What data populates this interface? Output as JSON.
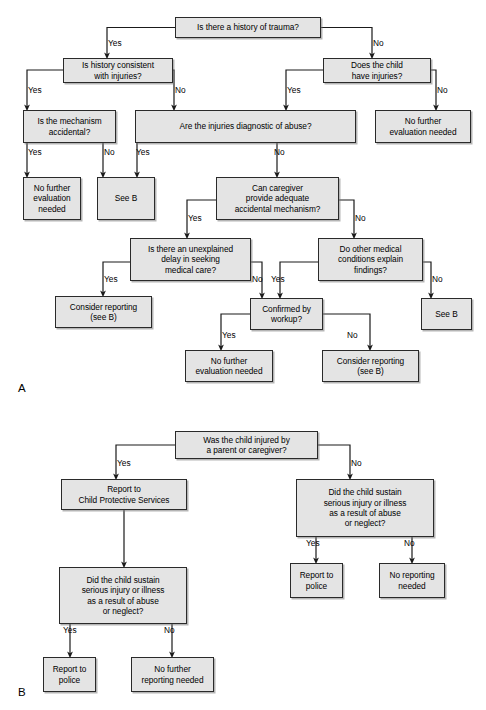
{
  "figure": {
    "panels": [
      {
        "id": "A",
        "label": "A",
        "x": 18,
        "y": 382
      },
      {
        "id": "B",
        "label": "B",
        "x": 18,
        "y": 686
      }
    ]
  },
  "panel_a": {
    "nodes": [
      {
        "name": "history-of-trauma",
        "text": "Is there a history of trauma?",
        "x": 175,
        "y": 17,
        "w": 146,
        "h": 21
      },
      {
        "name": "history-consistent",
        "text": "Is history consistent\nwith injuries?",
        "x": 63,
        "y": 58,
        "w": 110,
        "h": 25
      },
      {
        "name": "child-have-injuries",
        "text": "Does the child\nhave injuries?",
        "x": 323,
        "y": 58,
        "w": 108,
        "h": 25
      },
      {
        "name": "mechanism-accidental",
        "text": "Is the mechanism\naccidental?",
        "x": 23,
        "y": 110,
        "w": 93,
        "h": 33
      },
      {
        "name": "injuries-diagnostic",
        "text": "Are the injuries diagnostic of abuse?",
        "x": 135,
        "y": 110,
        "w": 221,
        "h": 33
      },
      {
        "name": "no-further-eval-right",
        "text": "No further\nevaluation needed",
        "x": 375,
        "y": 110,
        "w": 96,
        "h": 33
      },
      {
        "name": "no-further-eval-left",
        "text": "No further\nevaluation\nneeded",
        "x": 23,
        "y": 177,
        "w": 58,
        "h": 43
      },
      {
        "name": "see-b-left",
        "text": "See B",
        "x": 97,
        "y": 177,
        "w": 58,
        "h": 43
      },
      {
        "name": "caregiver-mechanism",
        "text": "Can caregiver\nprovide adequate\naccidental mechanism?",
        "x": 216,
        "y": 177,
        "w": 123,
        "h": 43
      },
      {
        "name": "unexplained-delay",
        "text": "Is there an unexplained\ndelay in seeking\nmedical care?",
        "x": 130,
        "y": 238,
        "w": 121,
        "h": 43
      },
      {
        "name": "other-medical-conditions",
        "text": "Do other medical\nconditions explain\nfindings?",
        "x": 318,
        "y": 238,
        "w": 105,
        "h": 43
      },
      {
        "name": "consider-reporting-left",
        "text": "Consider reporting\n(see B)",
        "x": 55,
        "y": 296,
        "w": 97,
        "h": 32
      },
      {
        "name": "confirmed-by-workup",
        "text": "Confirmed by\nworkup?",
        "x": 250,
        "y": 298,
        "w": 73,
        "h": 32
      },
      {
        "name": "see-b-right",
        "text": "See B",
        "x": 421,
        "y": 298,
        "w": 51,
        "h": 32
      },
      {
        "name": "no-further-eval-bottom",
        "text": "No further\nevaluation needed",
        "x": 185,
        "y": 350,
        "w": 88,
        "h": 32
      },
      {
        "name": "consider-reporting-right",
        "text": "Consider reporting\n(see B)",
        "x": 322,
        "y": 350,
        "w": 97,
        "h": 32
      }
    ],
    "edge_labels": [
      {
        "text": "Yes",
        "x": 108,
        "y": 39
      },
      {
        "text": "No",
        "x": 373,
        "y": 39
      },
      {
        "text": "Yes",
        "x": 28,
        "y": 86
      },
      {
        "text": "No",
        "x": 175,
        "y": 86
      },
      {
        "text": "Yes",
        "x": 287,
        "y": 86
      },
      {
        "text": "No",
        "x": 437,
        "y": 86
      },
      {
        "text": "Yes",
        "x": 28,
        "y": 148
      },
      {
        "text": "No",
        "x": 104,
        "y": 148
      },
      {
        "text": "Yes",
        "x": 136,
        "y": 148
      },
      {
        "text": "No",
        "x": 274,
        "y": 148
      },
      {
        "text": "Yes",
        "x": 188,
        "y": 214
      },
      {
        "text": "No",
        "x": 355,
        "y": 214
      },
      {
        "text": "Yes",
        "x": 104,
        "y": 275
      },
      {
        "text": "No",
        "x": 252,
        "y": 275
      },
      {
        "text": "Yes",
        "x": 271,
        "y": 275
      },
      {
        "text": "No",
        "x": 432,
        "y": 275
      },
      {
        "text": "Yes",
        "x": 222,
        "y": 331
      },
      {
        "text": "No",
        "x": 347,
        "y": 331
      }
    ]
  },
  "panel_b": {
    "nodes": [
      {
        "name": "child-injured-by-parent",
        "text": "Was the child injured by\na parent or caregiver?",
        "x": 175,
        "y": 431,
        "w": 143,
        "h": 28
      },
      {
        "name": "report-to-cps",
        "text": "Report to\nChild Protective Services",
        "x": 61,
        "y": 479,
        "w": 126,
        "h": 31
      },
      {
        "name": "did-child-sustain-right",
        "text": "Did the child sustain\nserious injury or illness\nas a result of abuse\nor neglect?",
        "x": 296,
        "y": 479,
        "w": 138,
        "h": 58
      },
      {
        "name": "did-child-sustain-left",
        "text": "Did the child sustain\nserious injury or illness\nas a result of abuse\nor neglect?",
        "x": 59,
        "y": 567,
        "w": 128,
        "h": 57
      },
      {
        "name": "report-to-police-right",
        "text": "Report to\npolice",
        "x": 290,
        "y": 563,
        "w": 53,
        "h": 35
      },
      {
        "name": "no-reporting-needed",
        "text": "No reporting\nneeded",
        "x": 379,
        "y": 563,
        "w": 66,
        "h": 35
      },
      {
        "name": "report-to-police-left",
        "text": "Report to\npolice",
        "x": 43,
        "y": 657,
        "w": 53,
        "h": 35
      },
      {
        "name": "no-further-reporting",
        "text": "No further\nreporting needed",
        "x": 131,
        "y": 657,
        "w": 83,
        "h": 35
      }
    ],
    "edge_labels": [
      {
        "text": "Yes",
        "x": 117,
        "y": 459
      },
      {
        "text": "No",
        "x": 351,
        "y": 459
      },
      {
        "text": "Yes",
        "x": 306,
        "y": 539
      },
      {
        "text": "No",
        "x": 404,
        "y": 539
      },
      {
        "text": "Yes",
        "x": 63,
        "y": 626
      },
      {
        "text": "No",
        "x": 164,
        "y": 626
      }
    ]
  },
  "connectors": {
    "stroke": "#1a1a1a",
    "stroke_width": 1.2
  }
}
